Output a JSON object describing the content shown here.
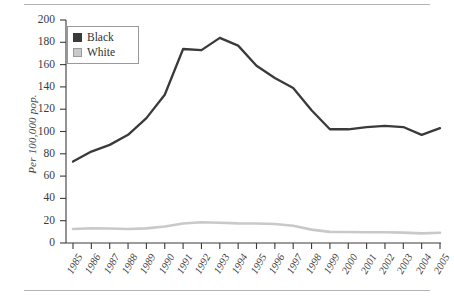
{
  "figure": {
    "ylabel": "Per 100,000 pop.",
    "rules": {
      "top": "horizontal-rule",
      "bottom": "horizontal-rule"
    }
  },
  "legend": {
    "position": "top-left-inside",
    "entries": [
      {
        "label": "Black",
        "color": "#3a3a3a",
        "border": "#3a3a3a"
      },
      {
        "label": "White",
        "color": "#c9c9c9",
        "border": "#9a9a9a"
      }
    ]
  },
  "chart_data": {
    "type": "line",
    "title": "",
    "subtitle": "",
    "xlabel": "",
    "ylabel": "Per 100,000 pop.",
    "grid": false,
    "legend_position": "top-left-inside",
    "xlim": [
      1985,
      2005
    ],
    "ylim": [
      0,
      200
    ],
    "yticks": [
      0,
      20,
      40,
      60,
      80,
      100,
      120,
      140,
      160,
      180,
      200
    ],
    "categories": [
      "1985",
      "1986",
      "1987",
      "1988",
      "1989",
      "1990",
      "1991",
      "1992",
      "1993",
      "1994",
      "1995",
      "1996",
      "1997",
      "1998",
      "1999",
      "2000",
      "2001",
      "2002",
      "2003",
      "2004",
      "2005"
    ],
    "series": [
      {
        "name": "Black",
        "color": "#3a3a3a",
        "values": [
          73,
          82,
          88,
          97,
          112,
          133,
          174,
          173,
          184,
          177,
          159,
          148,
          139,
          119,
          102,
          102,
          104,
          105,
          104,
          97,
          103
        ]
      },
      {
        "name": "White",
        "color": "#c9c9c9",
        "values": [
          12.5,
          13.2,
          13.0,
          12.6,
          13.1,
          14.8,
          17.5,
          18.6,
          18.1,
          17.6,
          17.5,
          17.0,
          15.4,
          12.0,
          10.0,
          9.8,
          9.6,
          9.6,
          9.3,
          8.6,
          9.2
        ]
      }
    ]
  }
}
